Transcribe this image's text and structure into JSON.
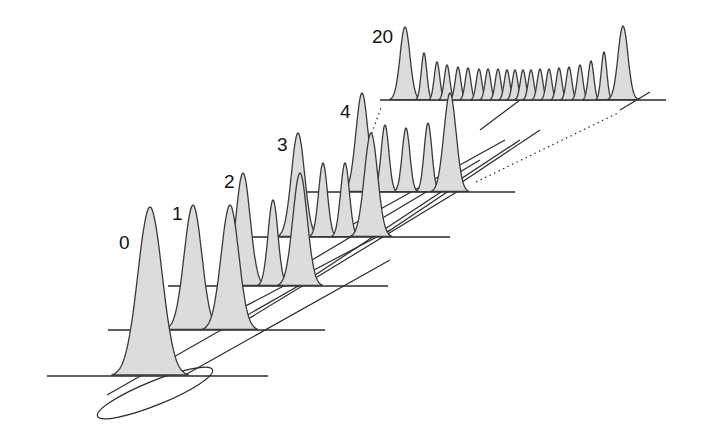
{
  "diagram": {
    "colors": {
      "fill": "#dcdcdc",
      "stroke": "#3a3a3a",
      "background": "#ffffff"
    },
    "steps": [
      {
        "label": "0",
        "label_pos": [
          119,
          233
        ],
        "baseline": {
          "y": 376,
          "x1": 47,
          "x2": 268
        },
        "peaks": [
          {
            "x": 150,
            "top": 207,
            "w": 22
          }
        ]
      },
      {
        "label": "1",
        "label_pos": [
          172,
          204
        ],
        "baseline": {
          "y": 330,
          "x1": 108,
          "x2": 325
        },
        "peaks": [
          {
            "x": 193,
            "top": 205,
            "w": 16
          },
          {
            "x": 230,
            "top": 205,
            "w": 16
          }
        ]
      },
      {
        "label": "2",
        "label_pos": [
          224,
          172
        ],
        "baseline": {
          "y": 286,
          "x1": 168,
          "x2": 388
        },
        "peaks": [
          {
            "x": 243,
            "top": 173,
            "w": 13
          },
          {
            "x": 273,
            "top": 200,
            "w": 9
          },
          {
            "x": 300,
            "top": 173,
            "w": 13
          }
        ]
      },
      {
        "label": "3",
        "label_pos": [
          277,
          135
        ],
        "baseline": {
          "y": 237,
          "x1": 230,
          "x2": 450
        },
        "peaks": [
          {
            "x": 298,
            "top": 133,
            "w": 12
          },
          {
            "x": 323,
            "top": 163,
            "w": 8
          },
          {
            "x": 345,
            "top": 163,
            "w": 8
          },
          {
            "x": 371,
            "top": 133,
            "w": 12
          }
        ]
      },
      {
        "label": "4",
        "label_pos": [
          340,
          102
        ],
        "baseline": {
          "y": 192,
          "x1": 292,
          "x2": 515
        },
        "peaks": [
          {
            "x": 362,
            "top": 93,
            "w": 11
          },
          {
            "x": 385,
            "top": 125,
            "w": 7
          },
          {
            "x": 406,
            "top": 128,
            "w": 7
          },
          {
            "x": 428,
            "top": 123,
            "w": 7
          },
          {
            "x": 450,
            "top": 93,
            "w": 11
          }
        ]
      },
      {
        "label": "20",
        "label_pos": [
          372,
          27
        ],
        "baseline": {
          "y": 100,
          "x1": 380,
          "x2": 666
        },
        "peaks": [
          {
            "x": 405,
            "top": 27,
            "w": 9
          },
          {
            "x": 424,
            "top": 53,
            "w": 5
          },
          {
            "x": 437,
            "top": 62,
            "w": 5
          },
          {
            "x": 447,
            "top": 65,
            "w": 5
          },
          {
            "x": 458,
            "top": 67,
            "w": 5
          },
          {
            "x": 468,
            "top": 68,
            "w": 5
          },
          {
            "x": 479,
            "top": 69,
            "w": 5
          },
          {
            "x": 488,
            "top": 69,
            "w": 5
          },
          {
            "x": 498,
            "top": 69,
            "w": 5
          },
          {
            "x": 507,
            "top": 70,
            "w": 5
          },
          {
            "x": 515,
            "top": 70,
            "w": 5
          },
          {
            "x": 523,
            "top": 70,
            "w": 5
          },
          {
            "x": 531,
            "top": 70,
            "w": 5
          },
          {
            "x": 540,
            "top": 69,
            "w": 5
          },
          {
            "x": 549,
            "top": 69,
            "w": 5
          },
          {
            "x": 559,
            "top": 68,
            "w": 5
          },
          {
            "x": 569,
            "top": 67,
            "w": 5
          },
          {
            "x": 580,
            "top": 65,
            "w": 5
          },
          {
            "x": 591,
            "top": 61,
            "w": 5
          },
          {
            "x": 604,
            "top": 52,
            "w": 5
          },
          {
            "x": 623,
            "top": 26,
            "w": 9
          }
        ]
      }
    ],
    "connectors": {
      "solid": [
        [
          107,
          395,
          300,
          285
        ],
        [
          185,
          375,
          390,
          260
        ],
        [
          200,
          330,
          390,
          230
        ],
        [
          230,
          330,
          460,
          190
        ],
        [
          270,
          285,
          480,
          160
        ],
        [
          300,
          285,
          520,
          140
        ],
        [
          330,
          237,
          505,
          140
        ],
        [
          380,
          237,
          540,
          130
        ],
        [
          480,
          130,
          520,
          100
        ],
        [
          620,
          110,
          650,
          92
        ]
      ],
      "dotted": [
        [
          370,
          138,
          382,
          105
        ],
        [
          476,
          182,
          620,
          112
        ]
      ]
    },
    "origin_ellipse": {
      "cx": 155,
      "cy": 393,
      "rx": 62,
      "ry": 12,
      "rotate": -22
    }
  }
}
